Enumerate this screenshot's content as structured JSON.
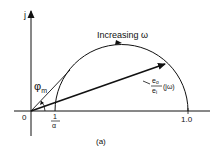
{
  "figure": {
    "caption": "(a)",
    "axes": {
      "vertical_label": "j",
      "origin_label": "0",
      "tick_inverse_alpha": {
        "numerator": "1",
        "denominator": "α"
      },
      "tick_one": "1.0"
    },
    "curve_label": "Increasing ω",
    "vector_label": {
      "numerator": "e",
      "numerator_sub": "o",
      "denominator": "e",
      "denominator_sub": "i",
      "argument": "(jω)"
    },
    "angle_label": {
      "symbol": "φ",
      "subscript": "m"
    },
    "colors": {
      "ink": "#111111",
      "background": "#ffffff"
    }
  }
}
